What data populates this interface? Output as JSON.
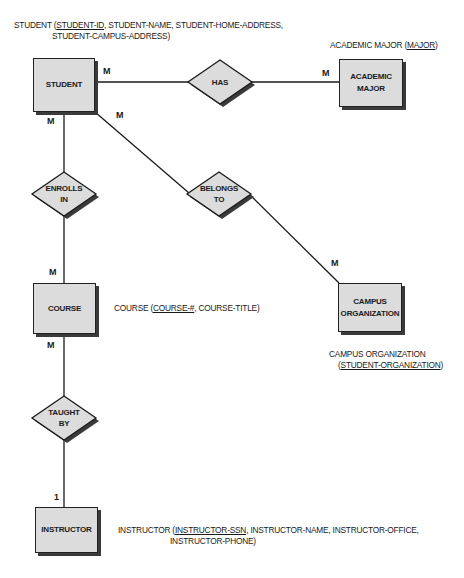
{
  "entities": {
    "student": {
      "label": "STUDENT"
    },
    "academic_major": {
      "line1": "ACADEMIC",
      "line2": "MAJOR"
    },
    "course": {
      "label": "COURSE"
    },
    "campus_organization": {
      "line1": "CAMPUS",
      "line2": "ORGANIZATION"
    },
    "instructor": {
      "label": "INSTRUCTOR"
    }
  },
  "relationships": {
    "has": {
      "label": "HAS"
    },
    "enrolls_in": {
      "line1": "ENROLLS",
      "line2": "IN"
    },
    "belongs_to": {
      "line1": "BELONGS",
      "line2": "TO"
    },
    "taught_by": {
      "line1": "TAUGHT",
      "line2": "BY"
    }
  },
  "cardinalities": {
    "student_has": "M",
    "major_has": "M",
    "student_enrolls": "M",
    "student_belongs": "M",
    "course_enrolls": "M",
    "org_belongs": "M",
    "course_taught": "M",
    "instructor_taught": "1"
  },
  "schemas": {
    "student": {
      "prefix": "STUDENT (",
      "key": "STUDENT-ID",
      "rest_line1": ", STUDENT-NAME, STUDENT-HOME-ADDRESS,",
      "line2": "STUDENT-CAMPUS-ADDRESS)"
    },
    "academic_major": {
      "prefix": "ACADEMIC MAJOR (",
      "key": "MAJOR",
      "suffix": ")"
    },
    "course": {
      "prefix": "COURSE (",
      "key": "COURSE-#",
      "suffix": ", COURSE-TITLE)"
    },
    "campus_organization": {
      "line1": "CAMPUS ORGANIZATION",
      "prefix2": "(",
      "key": "STUDENT-ORGANIZATION",
      "suffix2": ")"
    },
    "instructor": {
      "prefix": "INSTRUCTOR (",
      "key": "INSTRUCTOR-SSN",
      "rest_line1": ", INSTRUCTOR-NAME, INSTRUCTOR-OFFICE,",
      "line2": "INSTRUCTOR-PHONE)"
    }
  },
  "colors": {
    "entity_fill": "#dcdcdc",
    "line": "#1a1a1a",
    "shadow": "#3a3a3a"
  }
}
